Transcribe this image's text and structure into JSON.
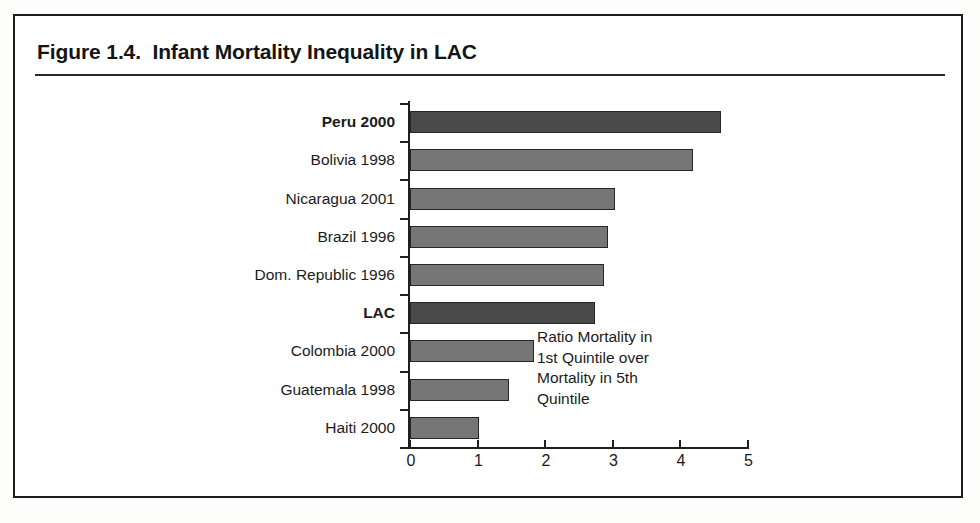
{
  "figure": {
    "title": "Figure 1.4.  Infant Mortality Inequality in LAC"
  },
  "annotation": {
    "text": "Ratio Mortality in\n1st Quintile over\nMortality in 5th\nQuintile"
  },
  "colors": {
    "bar_highlight": "#4a4a4a",
    "bar_normal": "#767676",
    "axis": "#1f1f1f",
    "frame": "#1d1d1d",
    "text": "#1b1b1b"
  },
  "chart_data": {
    "type": "bar",
    "orientation": "horizontal",
    "title": "Figure 1.4.  Infant Mortality Inequality in LAC",
    "xlabel": "",
    "ylabel": "",
    "xlim": [
      0,
      5
    ],
    "xticks": [
      "0",
      "1",
      "2",
      "3",
      "4",
      "5"
    ],
    "grid": false,
    "legend": false,
    "annotation": "Ratio Mortality in 1st Quintile over Mortality in 5th Quintile",
    "categories": [
      "Peru 2000",
      "Bolivia 1998",
      "Nicaragua 2001",
      "Brazil 1996",
      "Dom. Republic 1996",
      "LAC",
      "Colombia 2000",
      "Guatemala 1998",
      "Haiti 2000"
    ],
    "values": [
      4.6,
      4.19,
      3.04,
      2.93,
      2.87,
      2.74,
      1.83,
      1.47,
      1.02
    ],
    "highlighted": [
      "Peru 2000",
      "LAC"
    ],
    "bars": [
      {
        "label": "Peru 2000",
        "value": 4.6,
        "bold": true,
        "highlight": true
      },
      {
        "label": "Bolivia 1998",
        "value": 4.19,
        "bold": false,
        "highlight": false
      },
      {
        "label": "Nicaragua 2001",
        "value": 3.04,
        "bold": false,
        "highlight": false
      },
      {
        "label": "Brazil 1996",
        "value": 2.93,
        "bold": false,
        "highlight": false
      },
      {
        "label": "Dom. Republic 1996",
        "value": 2.87,
        "bold": false,
        "highlight": false
      },
      {
        "label": "LAC",
        "value": 2.74,
        "bold": true,
        "highlight": true
      },
      {
        "label": "Colombia 2000",
        "value": 1.83,
        "bold": false,
        "highlight": false
      },
      {
        "label": "Guatemala 1998",
        "value": 1.47,
        "bold": false,
        "highlight": false
      },
      {
        "label": "Haiti 2000",
        "value": 1.02,
        "bold": false,
        "highlight": false
      }
    ]
  }
}
